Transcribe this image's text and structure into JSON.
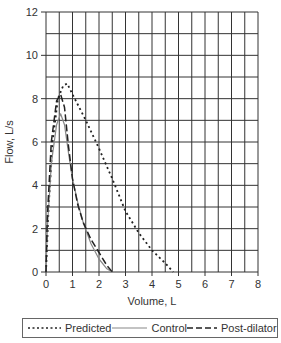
{
  "chart_data": {
    "type": "line",
    "title": "",
    "xlabel": "Volume, L",
    "ylabel": "Flow, L/s",
    "xlim": [
      0,
      8
    ],
    "ylim": [
      0,
      12
    ],
    "x_ticks": [
      "0",
      "1",
      "2",
      "3",
      "4",
      "5",
      "6",
      "7",
      "8"
    ],
    "y_ticks": [
      "0",
      "2",
      "4",
      "6",
      "8",
      "10",
      "12"
    ],
    "grid": true,
    "grid_x_step": 0.5,
    "grid_y_step": 1,
    "legend_position": "bottom",
    "series": [
      {
        "name": "Predicted",
        "style": "dotted",
        "points": [
          [
            0,
            0
          ],
          [
            0.1,
            3.0
          ],
          [
            0.25,
            6.0
          ],
          [
            0.45,
            8.0
          ],
          [
            0.65,
            8.6
          ],
          [
            0.8,
            8.7
          ],
          [
            1.0,
            8.2
          ],
          [
            1.5,
            7.0
          ],
          [
            2.0,
            5.7
          ],
          [
            2.5,
            4.3
          ],
          [
            3.0,
            2.8
          ],
          [
            3.5,
            1.8
          ],
          [
            4.0,
            1.0
          ],
          [
            4.5,
            0.4
          ],
          [
            4.8,
            0
          ]
        ]
      },
      {
        "name": "Control",
        "style": "solid",
        "color": "#888888",
        "points": [
          [
            0,
            0
          ],
          [
            0.05,
            2.0
          ],
          [
            0.2,
            5.0
          ],
          [
            0.4,
            6.8
          ],
          [
            0.55,
            7.3
          ],
          [
            0.7,
            6.8
          ],
          [
            0.85,
            5.5
          ],
          [
            1.0,
            4.3
          ],
          [
            1.2,
            3.2
          ],
          [
            1.4,
            2.3
          ],
          [
            1.7,
            1.3
          ],
          [
            2.0,
            0.6
          ],
          [
            2.3,
            0.15
          ],
          [
            2.5,
            0
          ]
        ]
      },
      {
        "name": "Post-dilator",
        "style": "dashed",
        "points": [
          [
            0,
            0
          ],
          [
            0.05,
            2.5
          ],
          [
            0.2,
            6.0
          ],
          [
            0.4,
            7.9
          ],
          [
            0.55,
            8.2
          ],
          [
            0.7,
            7.6
          ],
          [
            0.85,
            5.8
          ],
          [
            1.0,
            4.3
          ],
          [
            1.2,
            3.1
          ],
          [
            1.4,
            2.3
          ],
          [
            1.7,
            1.5
          ],
          [
            2.0,
            0.9
          ],
          [
            2.3,
            0.3
          ],
          [
            2.5,
            0
          ]
        ]
      }
    ]
  },
  "legend": {
    "items": [
      {
        "label": "Predicted"
      },
      {
        "label": "Control"
      },
      {
        "label": "Post-dilator"
      }
    ]
  }
}
